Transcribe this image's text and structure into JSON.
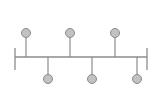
{
  "diagram": {
    "type": "timeline",
    "colors": {
      "background": "#ffffff",
      "line": "#8c8c8c",
      "node_fill": "#c2c2c2",
      "node_stroke": "#8a8a8a"
    },
    "axis": {
      "x_start": 15,
      "x_end": 147,
      "y": 57,
      "cap_top": 48,
      "cap_bottom": 70
    },
    "node_radius": 4.5,
    "nodes": [
      {
        "position": "top",
        "x": 26,
        "y": 33
      },
      {
        "position": "bottom",
        "x": 48,
        "y": 79
      },
      {
        "position": "top",
        "x": 70,
        "y": 33
      },
      {
        "position": "bottom",
        "x": 92,
        "y": 79
      },
      {
        "position": "top",
        "x": 115,
        "y": 33
      },
      {
        "position": "bottom",
        "x": 137,
        "y": 79
      }
    ]
  }
}
